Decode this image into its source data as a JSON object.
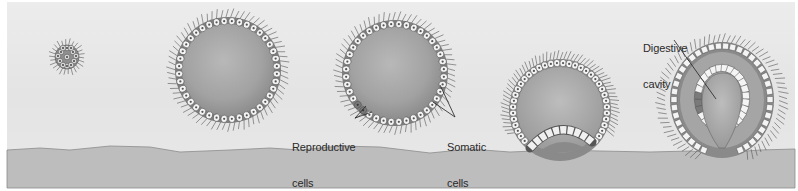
{
  "figure": {
    "stages": [
      {
        "id": 1,
        "name": "cell-cluster",
        "cx": 67,
        "cy": 57,
        "r": 12
      },
      {
        "id": 2,
        "name": "hollow-sphere",
        "cx": 228,
        "cy": 70,
        "r": 50
      },
      {
        "id": 3,
        "name": "differentiated-sphere",
        "cx": 395,
        "cy": 73,
        "r": 50
      },
      {
        "id": 4,
        "name": "invaginating-sphere",
        "cx": 560,
        "cy": 110,
        "r": 48
      },
      {
        "id": 5,
        "name": "gastrula",
        "cx": 722,
        "cy": 100,
        "r": 56
      }
    ],
    "labels": {
      "reproductive": {
        "line1": "Reproductive",
        "line2": "cells"
      },
      "somatic": {
        "line1": "Somatic",
        "line2": "cells"
      },
      "digestive": {
        "line1": "Digestive",
        "line2": "cavity"
      }
    },
    "colors": {
      "background": "#e6e6e6",
      "ground": "#bcbcbc",
      "ground_edge": "#8a8a8a",
      "sphere_fill": "#a9a9a9",
      "cell_fill": "#f4f4f4",
      "cell_stroke": "#555555",
      "reproductive_cell": "#7a7a7a",
      "cilia": "#555555",
      "label_text": "#2a2a2a"
    }
  }
}
